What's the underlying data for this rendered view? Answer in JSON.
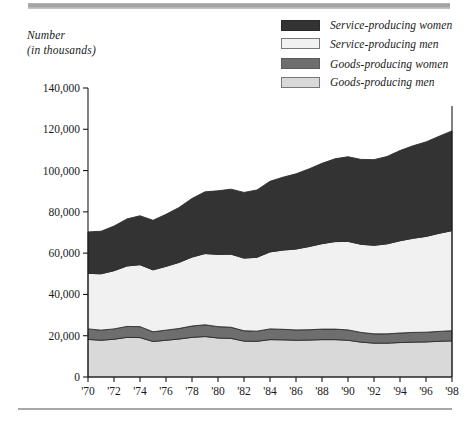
{
  "figure": {
    "y_axis_title_line1": "Number",
    "y_axis_title_line2": "(in thousands)"
  },
  "legend": {
    "position": "top-right",
    "items": [
      {
        "label": "Service-producing women",
        "swatch": "dark-charcoal-swatch",
        "color": "#333333"
      },
      {
        "label": "Service-producing men",
        "swatch": "near-white-swatch",
        "color": "#f1f1f1"
      },
      {
        "label": "Goods-producing women",
        "swatch": "medium-gray-swatch",
        "color": "#6e6e6e"
      },
      {
        "label": "Goods-producing men",
        "swatch": "light-gray-swatch",
        "color": "#d9d9d9"
      }
    ]
  },
  "chart_data": {
    "type": "area",
    "stacked": true,
    "title": "",
    "subtitle": "",
    "xlabel": "",
    "ylabel": "Number (in thousands)",
    "xlim": [
      1970,
      1998
    ],
    "ylim": [
      0,
      140000
    ],
    "ytick_step": 20000,
    "grid": false,
    "legend_position": "top-right",
    "ytick_labels": [
      "0",
      "20,000",
      "40,000",
      "60,000",
      "80,000",
      "100,000",
      "120,000",
      "140,000"
    ],
    "ytick_values": [
      0,
      20000,
      40000,
      60000,
      80000,
      100000,
      120000,
      140000
    ],
    "xtick_labels": [
      "'70",
      "'72",
      "'74",
      "'76",
      "'78",
      "'80",
      "'82",
      "'84",
      "'86",
      "'88",
      "'90",
      "'92",
      "'94",
      "'96",
      "'98"
    ],
    "xtick_values": [
      1970,
      1972,
      1974,
      1976,
      1978,
      1980,
      1982,
      1984,
      1986,
      1988,
      1990,
      1992,
      1994,
      1996,
      1998
    ],
    "x": [
      1970,
      1971,
      1972,
      1973,
      1974,
      1975,
      1976,
      1977,
      1978,
      1979,
      1980,
      1981,
      1982,
      1983,
      1984,
      1985,
      1986,
      1987,
      1988,
      1989,
      1990,
      1991,
      1992,
      1993,
      1994,
      1995,
      1996,
      1997,
      1998
    ],
    "series": [
      {
        "name": "Goods-producing men",
        "color": "#d9d9d9",
        "stack_order": 1,
        "values": [
          18200,
          17800,
          18300,
          19200,
          19100,
          17200,
          17800,
          18400,
          19200,
          19600,
          18900,
          18700,
          17400,
          17300,
          18100,
          18000,
          17800,
          17900,
          18100,
          18100,
          17800,
          16900,
          16400,
          16400,
          16700,
          16900,
          17000,
          17300,
          17500
        ]
      },
      {
        "name": "Goods-producing women",
        "color": "#6e6e6e",
        "stack_order": 2,
        "values": [
          5100,
          4900,
          5000,
          5300,
          5300,
          4700,
          4900,
          5100,
          5500,
          5700,
          5500,
          5400,
          5000,
          4900,
          5200,
          5100,
          5000,
          5000,
          5100,
          5100,
          5000,
          4700,
          4500,
          4500,
          4600,
          4700,
          4700,
          4800,
          4900
        ]
      },
      {
        "name": "Service-producing men",
        "color": "#f1f1f1",
        "stack_order": 3,
        "values": [
          26900,
          27300,
          28200,
          29300,
          30000,
          30000,
          30900,
          32000,
          33400,
          34500,
          35000,
          35400,
          35200,
          35800,
          37300,
          38400,
          39200,
          40300,
          41400,
          42400,
          42900,
          42700,
          42900,
          43600,
          44700,
          45600,
          46400,
          47500,
          48500
        ]
      },
      {
        "name": "Service-producing women",
        "color": "#333333",
        "stack_order": 4,
        "values": [
          20100,
          20600,
          21600,
          22800,
          23700,
          24000,
          25200,
          26600,
          28400,
          29900,
          30800,
          31500,
          31800,
          32600,
          34200,
          35300,
          36400,
          37600,
          38900,
          40100,
          41000,
          41100,
          41500,
          42300,
          43700,
          44800,
          45800,
          47000,
          48300
        ]
      }
    ],
    "totals": [
      70300,
      70600,
      73100,
      76600,
      78100,
      75900,
      78800,
      82100,
      86500,
      89700,
      90200,
      91000,
      89400,
      90600,
      94800,
      96800,
      98400,
      100800,
      103500,
      105700,
      106700,
      105400,
      105300,
      106800,
      109700,
      112000,
      113900,
      116600,
      119200
    ]
  }
}
